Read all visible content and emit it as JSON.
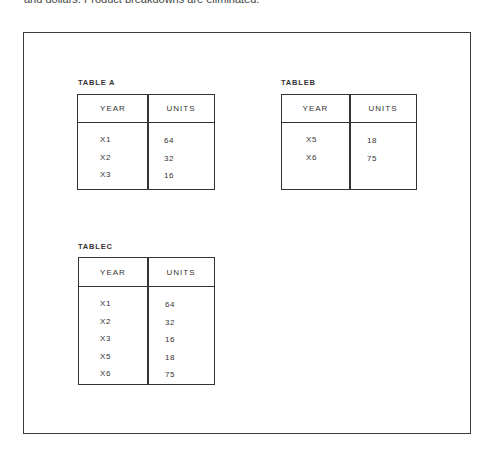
{
  "intro_text": "and dollars. Product breakdowns are eliminated.",
  "tables": {
    "a": {
      "label": "TABLE A",
      "headers": [
        "YEAR",
        "UNITS"
      ],
      "rows": [
        {
          "year": "X1",
          "units": "64"
        },
        {
          "year": "X2",
          "units": "32"
        },
        {
          "year": "X3",
          "units": "16"
        }
      ]
    },
    "b": {
      "label": "TABLEB",
      "headers": [
        "YEAR",
        "UNITS"
      ],
      "rows": [
        {
          "year": "X5",
          "units": "18"
        },
        {
          "year": "X6",
          "units": "75"
        }
      ]
    },
    "c": {
      "label": "TABLEC",
      "headers": [
        "YEAR",
        "UNITS"
      ],
      "rows": [
        {
          "year": "X1",
          "units": "64"
        },
        {
          "year": "X2",
          "units": "32"
        },
        {
          "year": "X3",
          "units": "16"
        },
        {
          "year": "X5",
          "units": "18"
        },
        {
          "year": "X6",
          "units": "75"
        }
      ]
    }
  }
}
